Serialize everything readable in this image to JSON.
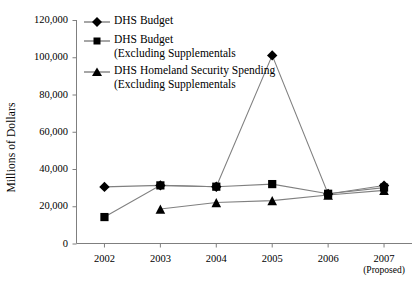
{
  "chart_data": {
    "type": "line",
    "title": "",
    "xlabel": "",
    "ylabel": "Millions of Dollars",
    "x": [
      "2002",
      "2003",
      "2004",
      "2005",
      "2006",
      "2007"
    ],
    "x_tick_sublabels": [
      "",
      "",
      "",
      "",
      "",
      "(Proposed)"
    ],
    "ylim": [
      0,
      120000
    ],
    "y_ticks": [
      0,
      20000,
      40000,
      60000,
      80000,
      100000,
      120000
    ],
    "y_tick_labels": [
      "0",
      "20,000",
      "40,000",
      "60,000",
      "80,000",
      "100,000",
      "120,000"
    ],
    "grid": false,
    "legend_position": "upper-left-inside",
    "series": [
      {
        "name": "DHS Budget",
        "marker": "diamond",
        "values": [
          30400,
          31200,
          30500,
          101000,
          26600,
          31100
        ]
      },
      {
        "name": "DHS Budget\n(Excluding Supplementals",
        "marker": "square",
        "values": [
          14200,
          31200,
          30500,
          31900,
          26700,
          30000
        ]
      },
      {
        "name": "DHS Homeland Security Spending\n(Excluding Supplementals",
        "marker": "triangle",
        "values": [
          null,
          18500,
          22000,
          23000,
          26000,
          28500
        ]
      }
    ]
  },
  "axis": {
    "y_title": "Millions of Dollars"
  },
  "legend": {
    "items": [
      {
        "label": "DHS Budget",
        "marker": "diamond-marker-icon"
      },
      {
        "label": "DHS Budget\n(Excluding Supplementals",
        "marker": "square-marker-icon"
      },
      {
        "label": "DHS Homeland Security Spending\n(Excluding Supplementals",
        "marker": "triangle-marker-icon"
      }
    ]
  },
  "colors": {
    "line": "#808080",
    "marker": "#000000",
    "axis": "#7f7f7f",
    "text": "#000000"
  }
}
